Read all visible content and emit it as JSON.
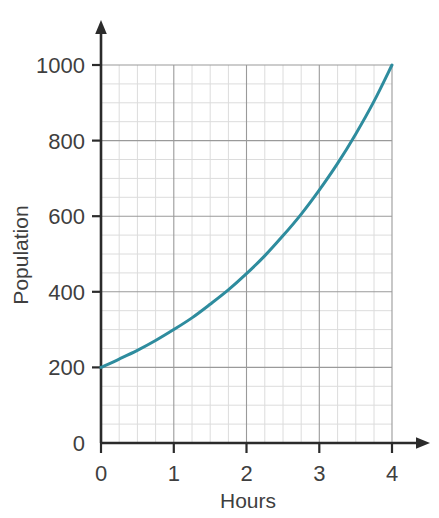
{
  "chart_data": {
    "type": "line",
    "title": "",
    "subtitle": "",
    "xlabel": "Hours",
    "ylabel": "Population",
    "xlim": [
      0,
      4
    ],
    "ylim": [
      0,
      1000
    ],
    "grid": true,
    "grid_major": true,
    "grid_minor": true,
    "legend": "none",
    "x_ticks": [
      "0",
      "1",
      "2",
      "3",
      "4"
    ],
    "x_tick_values": [
      0,
      1,
      2,
      3,
      4
    ],
    "y_ticks": [
      "0",
      "200",
      "400",
      "600",
      "800",
      "1000"
    ],
    "y_tick_values": [
      0,
      200,
      400,
      600,
      800,
      1000
    ],
    "x_minor_step": 0.25,
    "y_minor_step": 50,
    "series": [
      {
        "name": "Population",
        "color": "#2e8c9e",
        "line_width": 3,
        "x": [
          0,
          0.25,
          0.5,
          0.75,
          1,
          1.25,
          1.5,
          1.75,
          2,
          2.25,
          2.5,
          2.75,
          3,
          3.25,
          3.5,
          3.75,
          4
        ],
        "values": [
          200,
          222,
          245,
          271,
          300,
          331,
          367,
          405,
          448,
          495,
          548,
          605,
          669,
          739,
          817,
          903,
          1000
        ]
      }
    ],
    "annotations": []
  },
  "axes": {
    "y_axis_name": "vertical-axis",
    "x_axis_name": "horizontal-axis",
    "arrow_up": true,
    "arrow_right": true
  },
  "colors": {
    "curve": "#2e8c9e",
    "axis": "#2b2b2b",
    "grid_major": "#9a9a9a",
    "grid_minor": "#d8d8d8",
    "text": "#3f3f3f",
    "background": "#ffffff"
  }
}
